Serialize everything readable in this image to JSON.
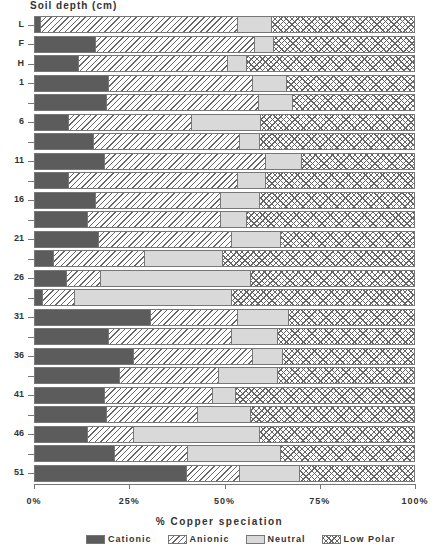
{
  "chart_data": {
    "type": "bar",
    "orientation": "horizontal",
    "stacked": "100%",
    "title": "",
    "ylabel": "Soil depth (cm)",
    "xlabel": "% Copper speciation",
    "xlim": [
      0,
      100
    ],
    "x_ticks": [
      "0%",
      "25%",
      "50%",
      "75%",
      "100%"
    ],
    "categories": [
      "L",
      "F",
      "H",
      "1",
      "",
      "6",
      "",
      "11",
      "",
      "16",
      "",
      "21",
      "",
      "26",
      "",
      "31",
      "",
      "36",
      "",
      "41",
      "",
      "46",
      "",
      "51"
    ],
    "legend_position": "bottom",
    "grid": false,
    "series": [
      {
        "name": "Cationic",
        "values": [
          1.5,
          16,
          11.5,
          19.5,
          19,
          9,
          15.5,
          18.5,
          9,
          16,
          14,
          17,
          5,
          8.5,
          2,
          30.5,
          19.5,
          26,
          22.5,
          18.5,
          19,
          14,
          21,
          40
        ]
      },
      {
        "name": "Anionic",
        "values": [
          52,
          42,
          39.5,
          38,
          40,
          32.5,
          38.5,
          42.5,
          44.5,
          33,
          35,
          35,
          24,
          9,
          8.5,
          23,
          32.5,
          31.5,
          26,
          28.5,
          24,
          12,
          19.5,
          14
        ]
      },
      {
        "name": "Neutral",
        "values": [
          9,
          5,
          5,
          9,
          9,
          18,
          5.5,
          9.5,
          7.5,
          10.5,
          7,
          13,
          20.5,
          39.5,
          41.5,
          13.5,
          12,
          8,
          15.5,
          6,
          14,
          33.5,
          24.5,
          16
        ]
      },
      {
        "name": "Low Polar",
        "values": [
          37.5,
          37,
          44,
          33.5,
          32,
          40.5,
          40.5,
          29.5,
          39,
          40.5,
          44,
          35,
          50.5,
          43,
          48,
          33,
          36,
          34.5,
          36,
          47,
          43,
          40.5,
          35,
          30
        ]
      }
    ]
  },
  "y_axis": {
    "title": "Soil depth (cm)",
    "labels": [
      "L",
      "F",
      "H",
      "1",
      "",
      "6",
      "",
      "11",
      "",
      "16",
      "",
      "21",
      "",
      "26",
      "",
      "31",
      "",
      "36",
      "",
      "41",
      "",
      "46",
      "",
      "51"
    ]
  },
  "x_axis": {
    "title": "% Copper speciation",
    "ticks": [
      "0%",
      "25%",
      "50%",
      "75%",
      "100%"
    ]
  },
  "legend": {
    "items": [
      {
        "label": "Cationic",
        "key": "cationic"
      },
      {
        "label": "Anionic",
        "key": "anionic"
      },
      {
        "label": "Neutral",
        "key": "neutral"
      },
      {
        "label": "Low Polar",
        "key": "lowpolar"
      }
    ]
  }
}
